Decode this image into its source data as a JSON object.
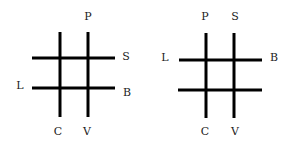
{
  "diagrams": [
    {
      "name": "left-grid",
      "line_color": "#000000",
      "labels": {
        "top": "P",
        "right_upper": "S",
        "left_lower": "L",
        "right_lower": "B",
        "bottom_left": "C",
        "bottom_right": "V"
      }
    },
    {
      "name": "right-grid",
      "line_color": "#000000",
      "labels": {
        "top_left": "P",
        "top_right": "S",
        "left_upper": "L",
        "right_upper": "B",
        "bottom_left": "C",
        "bottom_right": "V"
      }
    }
  ]
}
